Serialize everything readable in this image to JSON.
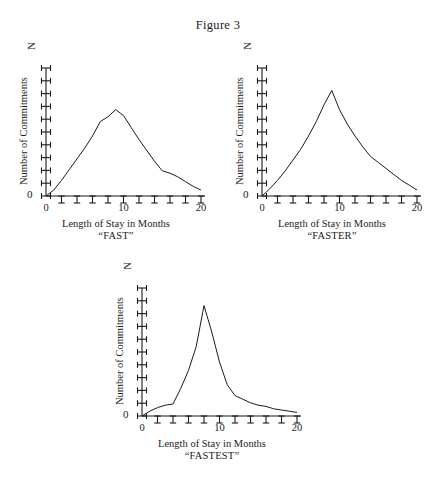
{
  "figure": {
    "title": "Figure 3",
    "background": "#ffffff",
    "ink": "#1a1a1a"
  },
  "axis_common": {
    "ylabel": "Number of Commitments",
    "y_top_label": "N",
    "y_zero_label": "0",
    "xlabel": "Length of Stay in Months",
    "x_tick_labels": [
      "0",
      "10",
      "20"
    ],
    "x_tick_values": [
      0,
      10,
      20
    ],
    "x_minor_ticks": [
      2,
      4,
      6,
      8,
      10,
      12,
      14,
      16,
      18,
      20
    ],
    "y_tick_count": 11,
    "xlim": [
      0,
      20
    ],
    "ylim": [
      0,
      100
    ]
  },
  "chart_data": [
    {
      "type": "line",
      "id": "fast",
      "title": "“FAST”",
      "subtitle": "Length of Stay in Months",
      "xlabel": "Length of Stay in Months",
      "ylabel": "Number of Commitments",
      "xlim": [
        0,
        20
      ],
      "ylim": [
        0,
        100
      ],
      "grid": false,
      "legend": "none",
      "x": [
        0,
        1,
        2,
        3,
        4,
        5,
        6,
        7,
        8,
        9,
        10,
        11,
        12,
        13,
        14,
        15,
        16,
        17,
        18,
        19,
        20
      ],
      "values": [
        0,
        5,
        13,
        22,
        31,
        40,
        50,
        62,
        66,
        72,
        67,
        57,
        47,
        38,
        29,
        21,
        19,
        16,
        12,
        8,
        5
      ]
    },
    {
      "type": "line",
      "id": "faster",
      "title": "“FASTER”",
      "subtitle": "Length of Stay in Months",
      "xlabel": "Length of Stay in Months",
      "ylabel": "Number of Commitments",
      "xlim": [
        0,
        20
      ],
      "ylim": [
        0,
        100
      ],
      "grid": false,
      "legend": "none",
      "x": [
        0,
        1,
        2,
        3,
        4,
        5,
        6,
        7,
        8,
        9,
        10,
        11,
        12,
        13,
        14,
        15,
        16,
        17,
        18,
        19,
        20
      ],
      "values": [
        0,
        6,
        13,
        21,
        30,
        39,
        50,
        62,
        76,
        88,
        72,
        60,
        50,
        41,
        33,
        28,
        23,
        18,
        13,
        9,
        5
      ]
    },
    {
      "type": "line",
      "id": "fastest",
      "title": "“FASTEST”",
      "subtitle": "Length of Stay in Months",
      "xlabel": "Length of Stay in Months",
      "ylabel": "Number of Commitments",
      "xlim": [
        0,
        20
      ],
      "ylim": [
        0,
        100
      ],
      "grid": false,
      "legend": "none",
      "x": [
        0,
        1,
        2,
        3,
        4,
        5,
        6,
        7,
        8,
        9,
        10,
        11,
        12,
        13,
        14,
        15,
        16,
        17,
        18,
        19,
        20
      ],
      "values": [
        0,
        4,
        7,
        9,
        10,
        23,
        38,
        58,
        92,
        70,
        45,
        26,
        17,
        14,
        11,
        9,
        8,
        6,
        5,
        4,
        3
      ]
    }
  ]
}
